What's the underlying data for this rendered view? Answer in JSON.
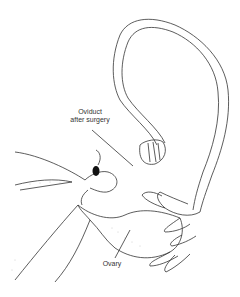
{
  "diagram": {
    "labels": {
      "oviduct_line1": "Oviduct",
      "oviduct_line2": "after surgery",
      "ovary": "Ovary"
    },
    "colors": {
      "stroke": "#333333",
      "background": "#ffffff",
      "stipple": "#888888"
    }
  }
}
